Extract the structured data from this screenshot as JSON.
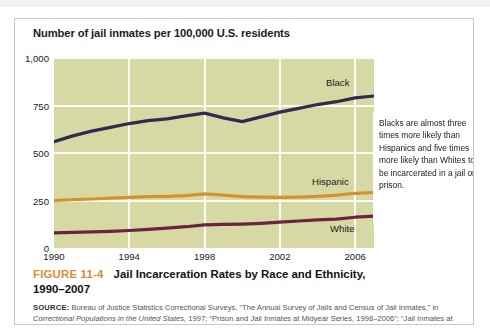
{
  "figure": {
    "number": "FIGURE 11-4",
    "title": "Jail Incarceration Rates by Race and Ethnicity,",
    "title_line2": "1990–2007",
    "source_label": "SOURCE:",
    "source_part1": " Bureau of Justice Statistics Correctional Surveys, “The Annual Survey of Jails and Census of Jail Inmates,” in ",
    "source_italic": "Correctional Populations in the United States,",
    "source_part2": " 1997; “Prison and Jail Inmates at Midyear Series, 1998–2006”; “Jail Inmates at Midyear 2007.”"
  },
  "callout": {
    "text": "Blacks are almost three times more likely than Hispanics and five times more likely than Whites to be incarcerated in a jail or prison."
  },
  "colors": {
    "plot_background": "#d7d9a5",
    "gridline": "#fbfbf2",
    "black_series": "#2e2d4e",
    "hispanic_series": "#d4922f",
    "white_series": "#6e2242",
    "figure_number": "#e08a33",
    "card_border": "#c9c9c9"
  },
  "chart_data": {
    "type": "line",
    "title": "Number of jail inmates per 100,000 U.S. residents",
    "xlabel": "",
    "ylabel": "",
    "xlim": [
      1990,
      2007
    ],
    "ylim": [
      0,
      1000
    ],
    "yticks": [
      0,
      250,
      500,
      750,
      1000
    ],
    "ytick_labels": [
      "0",
      "250",
      "500",
      "750",
      "1,000"
    ],
    "xticks": [
      1990,
      1994,
      1998,
      2002,
      2006
    ],
    "xtick_labels": [
      "1990",
      "1994",
      "1998",
      "2002",
      "2006"
    ],
    "grid": true,
    "legend": "inline-series-labels",
    "x": [
      1990,
      1991,
      1992,
      1993,
      1994,
      1995,
      1996,
      1997,
      1998,
      1999,
      2000,
      2001,
      2002,
      2003,
      2004,
      2005,
      2006,
      2007
    ],
    "series": [
      {
        "name": "Black",
        "color": "#2e2d4e",
        "values": [
          560,
          590,
          615,
          635,
          655,
          670,
          680,
          695,
          710,
          685,
          665,
          690,
          715,
          735,
          755,
          770,
          790,
          800
        ]
      },
      {
        "name": "Hispanic",
        "color": "#d4922f",
        "values": [
          250,
          255,
          258,
          262,
          266,
          270,
          272,
          276,
          285,
          278,
          270,
          268,
          266,
          268,
          272,
          278,
          288,
          292
        ]
      },
      {
        "name": "White",
        "color": "#6e2242",
        "values": [
          80,
          82,
          85,
          88,
          92,
          98,
          105,
          112,
          122,
          124,
          126,
          130,
          136,
          142,
          148,
          152,
          162,
          168
        ]
      }
    ]
  }
}
